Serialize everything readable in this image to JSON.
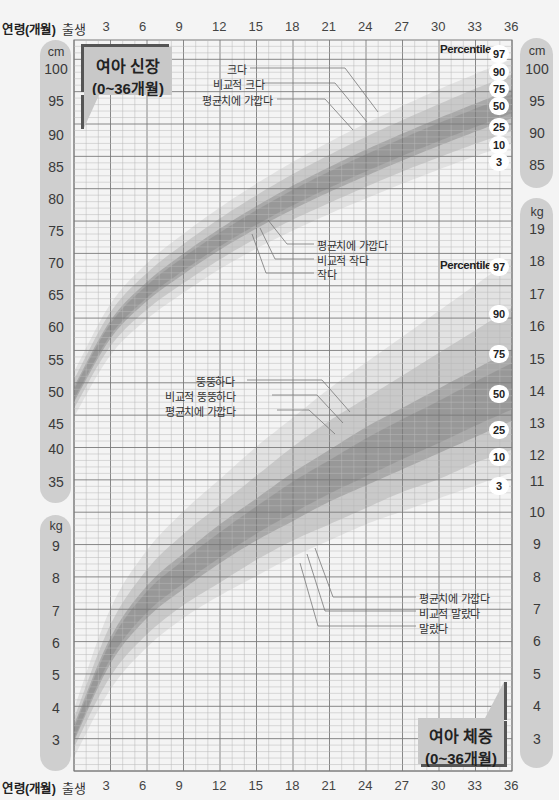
{
  "x_axis": {
    "label": "연령(개월)",
    "birth_label": "출생",
    "ticks": [
      "3",
      "6",
      "9",
      "12",
      "15",
      "18",
      "21",
      "24",
      "27",
      "30",
      "33",
      "36"
    ]
  },
  "height_panel": {
    "title_line1": "여아 신장",
    "title_line2": "(0~36개월)",
    "left_axis": {
      "unit": "cm",
      "ticks": [
        "100",
        "95",
        "90",
        "85",
        "80",
        "75",
        "70",
        "65",
        "60",
        "55",
        "50",
        "45",
        "40",
        "35"
      ]
    },
    "right_axis": {
      "unit": "cm",
      "ticks": [
        "100",
        "95",
        "90",
        "85"
      ]
    },
    "percentile_title": "Percentile",
    "percentiles": [
      "97",
      "90",
      "75",
      "50",
      "25",
      "10",
      "3"
    ],
    "annotations_top": [
      "크다",
      "비교적 크다",
      "평균치에 가깝다"
    ],
    "annotations_bottom": [
      "평균치에 가깝다",
      "비교적 작다",
      "작다"
    ]
  },
  "weight_panel": {
    "title_line1": "여아 체중",
    "title_line2": "(0~36개월)",
    "left_axis": {
      "unit": "kg",
      "ticks": [
        "9",
        "8",
        "7",
        "6",
        "5",
        "4",
        "3"
      ]
    },
    "right_axis": {
      "unit": "kg",
      "ticks": [
        "19",
        "18",
        "17",
        "16",
        "15",
        "14",
        "13",
        "12",
        "11",
        "10",
        "9",
        "8",
        "7",
        "6",
        "5",
        "4",
        "3"
      ]
    },
    "percentile_title": "Percentile",
    "percentiles": [
      "97",
      "90",
      "75",
      "50",
      "25",
      "10",
      "3"
    ],
    "annotations_top": [
      "뚱뚱하다",
      "비교적 뚱뚱하다",
      "평균치에 가깝다"
    ],
    "annotations_bottom": [
      "평균치에 가깝다",
      "비교적 말랐다",
      "말랐다"
    ]
  },
  "colors": {
    "background": "#f4f4f4",
    "grid_minor": "#b8b8b8",
    "grid_major": "#7a7a7a",
    "pill": "#cfcfcf",
    "band_outer": "#e2e2e2",
    "band_mid": "#c9c9c9",
    "band_inner": "#a9a9a9",
    "band_center": "#8e8e8e"
  },
  "chart_data": [
    {
      "type": "area",
      "title": "여아 신장 (0~36개월)",
      "xlabel": "연령(개월)",
      "ylabel": "cm",
      "x": [
        0,
        3,
        6,
        9,
        12,
        15,
        18,
        21,
        24,
        27,
        30,
        33,
        36
      ],
      "ylim": [
        35,
        102
      ],
      "grid": true,
      "legend_position": "right",
      "series": [
        {
          "name": "3",
          "values": [
            46.0,
            55.6,
            61.2,
            65.3,
            69.0,
            72.2,
            75.0,
            77.6,
            80.0,
            82.3,
            84.5,
            86.6,
            88.5
          ]
        },
        {
          "name": "10",
          "values": [
            47.3,
            57.0,
            62.7,
            66.8,
            70.5,
            73.8,
            76.7,
            79.3,
            81.8,
            84.2,
            86.4,
            88.5,
            90.5
          ]
        },
        {
          "name": "25",
          "values": [
            48.3,
            58.2,
            64.0,
            68.2,
            72.0,
            75.3,
            78.3,
            81.0,
            83.5,
            85.9,
            88.2,
            90.4,
            92.5
          ]
        },
        {
          "name": "50",
          "values": [
            49.5,
            59.6,
            65.5,
            69.8,
            73.6,
            77.0,
            80.1,
            82.9,
            85.5,
            88.0,
            90.3,
            92.5,
            94.7
          ]
        },
        {
          "name": "75",
          "values": [
            50.7,
            61.0,
            67.0,
            71.4,
            75.3,
            78.8,
            82.0,
            84.9,
            87.6,
            90.1,
            92.5,
            94.8,
            97.0
          ]
        },
        {
          "name": "90",
          "values": [
            51.8,
            62.3,
            68.4,
            72.9,
            76.9,
            80.5,
            83.8,
            86.8,
            89.6,
            92.2,
            94.7,
            97.1,
            99.3
          ]
        },
        {
          "name": "97",
          "values": [
            53.0,
            63.6,
            69.9,
            74.5,
            78.6,
            82.3,
            85.7,
            88.8,
            91.7,
            94.4,
            97.0,
            99.4,
            101.7
          ]
        }
      ]
    },
    {
      "type": "area",
      "title": "여아 체중 (0~36개월)",
      "xlabel": "연령(개월)",
      "ylabel": "kg",
      "x": [
        0,
        3,
        6,
        9,
        12,
        15,
        18,
        21,
        24,
        27,
        30,
        33,
        36
      ],
      "ylim": [
        2.5,
        19.5
      ],
      "grid": true,
      "legend_position": "right",
      "series": [
        {
          "name": "3",
          "values": [
            2.5,
            4.6,
            5.9,
            6.8,
            7.5,
            8.1,
            8.7,
            9.2,
            9.7,
            10.1,
            10.5,
            10.9,
            11.3
          ]
        },
        {
          "name": "10",
          "values": [
            2.8,
            5.0,
            6.3,
            7.2,
            7.9,
            8.6,
            9.2,
            9.7,
            10.2,
            10.7,
            11.1,
            11.6,
            12.0
          ]
        },
        {
          "name": "25",
          "values": [
            3.0,
            5.4,
            6.8,
            7.7,
            8.5,
            9.2,
            9.8,
            10.4,
            10.9,
            11.4,
            11.9,
            12.4,
            12.9
          ]
        },
        {
          "name": "50",
          "values": [
            3.2,
            5.8,
            7.3,
            8.2,
            9.0,
            9.8,
            10.5,
            11.1,
            11.7,
            12.3,
            12.8,
            13.4,
            13.9
          ]
        },
        {
          "name": "75",
          "values": [
            3.5,
            6.2,
            7.8,
            8.8,
            9.7,
            10.5,
            11.3,
            12.0,
            12.7,
            13.3,
            13.9,
            14.5,
            15.1
          ]
        },
        {
          "name": "90",
          "values": [
            3.7,
            6.6,
            8.3,
            9.4,
            10.3,
            11.2,
            12.1,
            12.9,
            13.6,
            14.3,
            15.0,
            15.7,
            16.4
          ]
        },
        {
          "name": "97",
          "values": [
            4.0,
            7.1,
            8.9,
            10.1,
            11.1,
            12.1,
            13.0,
            13.9,
            14.7,
            15.5,
            16.3,
            17.1,
            17.9
          ]
        }
      ]
    }
  ]
}
